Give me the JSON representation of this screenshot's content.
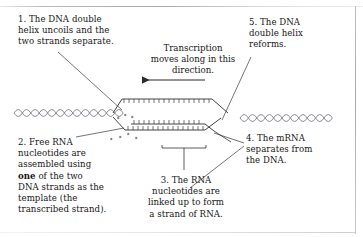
{
  "diagram": {
    "captions": {
      "step1": "1. The DNA double\nhelix uncoils and the\ntwo strands separate.",
      "step2_pre": "2. Free RNA\nnucleotides are\nassembled using\n",
      "step2_bold": "one",
      "step2_post": " of the two\nDNA strands as the\ntemplate (the\ntranscribed strand).",
      "step3": "3. The RNA\nnucleotides are\nlinked up to form\na strand of RNA.",
      "step4": "4. The mRNA\nseparates from\nthe DNA.",
      "step5": "5. The DNA\ndouble helix\nreforms."
    },
    "direction_label": "Transcription\nmoves along in this\ndirection.",
    "colors": {
      "background": "#ffffff",
      "ink": "#161616",
      "line": "#3a3a3a",
      "helix": "#6b6b78",
      "frame": "#b0b0b0"
    }
  }
}
